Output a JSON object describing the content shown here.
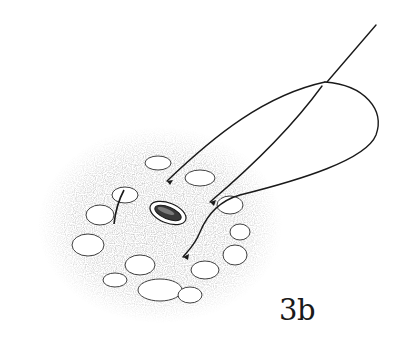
{
  "figure": {
    "label": "3b",
    "colors": {
      "ink": "#1a1a1a",
      "stipple": "#9a9a9a",
      "background": "#ffffff"
    }
  }
}
